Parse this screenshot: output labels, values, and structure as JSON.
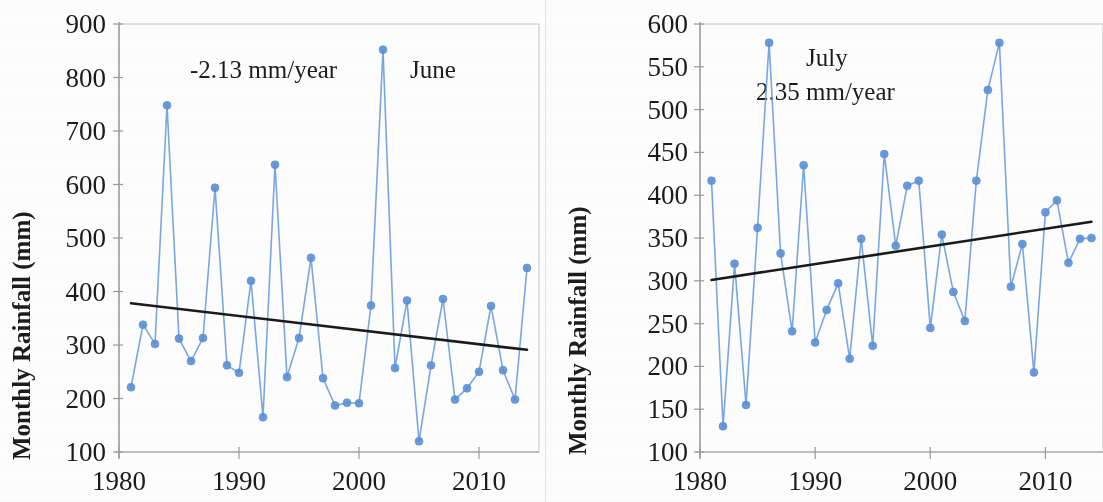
{
  "figure": {
    "background": "#fdfdfd",
    "series_color": "#6f9fe0",
    "marker_color": "#5b8fd4",
    "trend_color": "#1a1a1a",
    "axis_color": "#9a9a9a",
    "text_color": "#1b1b1b"
  },
  "chart_data": [
    {
      "type": "line",
      "id": "june",
      "title": "June",
      "annotation": "-2.13 mm/year",
      "xlabel": "",
      "ylabel": "Monthly Rainfall (mm)",
      "xlim": [
        1980,
        2015
      ],
      "ylim": [
        100,
        900
      ],
      "yticks": [
        100,
        200,
        300,
        400,
        500,
        600,
        700,
        800,
        900
      ],
      "xticks": [
        1980,
        1990,
        2000,
        2010
      ],
      "grid": false,
      "legend": "none",
      "trend_slope_mm_per_year": -2.13,
      "trendline": {
        "x": [
          1981,
          2014
        ],
        "y": [
          378,
          291
        ]
      },
      "x": [
        1981,
        1982,
        1983,
        1984,
        1985,
        1986,
        1987,
        1988,
        1989,
        1990,
        1991,
        1992,
        1993,
        1994,
        1995,
        1996,
        1997,
        1998,
        1999,
        2000,
        2001,
        2002,
        2003,
        2004,
        2005,
        2006,
        2007,
        2008,
        2009,
        2010,
        2011,
        2012,
        2013,
        2014
      ],
      "values": [
        221,
        338,
        302,
        748,
        312,
        270,
        313,
        594,
        262,
        248,
        420,
        165,
        637,
        240,
        313,
        463,
        238,
        187,
        192,
        191,
        374,
        852,
        257,
        383,
        120,
        262,
        386,
        198,
        219,
        250,
        373,
        253,
        198,
        444
      ]
    },
    {
      "type": "line",
      "id": "july",
      "title": "July",
      "annotation": "2.35 mm/year",
      "xlabel": "",
      "ylabel": "Monthly Rainfall (mm)",
      "xlim": [
        1980,
        2015
      ],
      "ylim": [
        100,
        600
      ],
      "yticks": [
        100,
        150,
        200,
        250,
        300,
        350,
        400,
        450,
        500,
        550,
        600
      ],
      "xticks": [
        1980,
        1990,
        2000,
        2010
      ],
      "grid": false,
      "legend": "none",
      "trend_slope_mm_per_year": 2.35,
      "trendline": {
        "x": [
          1981,
          2014
        ],
        "y": [
          301,
          369
        ]
      },
      "x": [
        1981,
        1982,
        1983,
        1984,
        1985,
        1986,
        1987,
        1988,
        1989,
        1990,
        1991,
        1992,
        1993,
        1994,
        1995,
        1996,
        1997,
        1998,
        1999,
        2000,
        2001,
        2002,
        2003,
        2004,
        2005,
        2006,
        2007,
        2008,
        2009,
        2010,
        2011,
        2012,
        2013,
        2014
      ],
      "values": [
        417,
        130,
        320,
        155,
        362,
        578,
        332,
        241,
        435,
        228,
        266,
        297,
        209,
        349,
        224,
        448,
        341,
        411,
        417,
        245,
        354,
        287,
        253,
        417,
        523,
        578,
        293,
        343,
        193,
        380,
        394,
        321,
        349,
        350
      ]
    }
  ],
  "panels": {
    "june": {
      "ylabel": "Monthly Rainfall (mm)",
      "annotation_rate": "-2.13 mm/year",
      "annotation_month": "June",
      "ytick_labels": [
        "900",
        "800",
        "700",
        "600",
        "500",
        "400",
        "300",
        "200",
        "100"
      ],
      "xtick_labels": [
        "1980",
        "1990",
        "2000",
        "2010"
      ]
    },
    "july": {
      "ylabel": "Monthly Rainfall (mm)",
      "annotation_rate": "2.35 mm/year",
      "annotation_month": "July",
      "ytick_labels": [
        "600",
        "550",
        "500",
        "450",
        "400",
        "350",
        "300",
        "250",
        "200",
        "150",
        "100"
      ],
      "xtick_labels": [
        "1980",
        "1990",
        "2000",
        "2010"
      ]
    }
  }
}
